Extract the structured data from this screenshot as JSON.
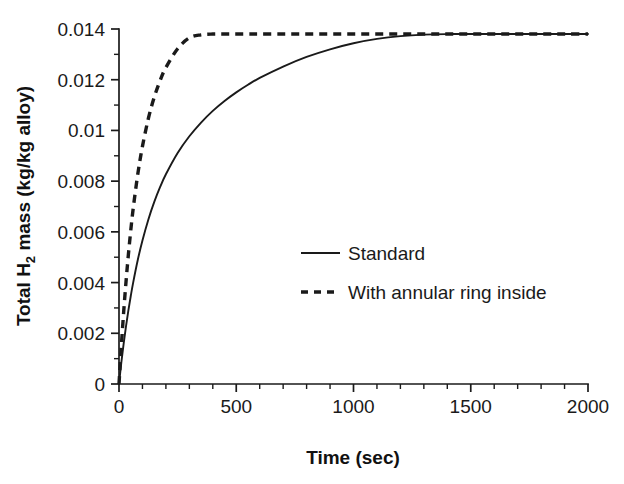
{
  "chart_data": {
    "type": "line",
    "title": "",
    "xlabel": "Time (sec)",
    "ylabel": "Total H2 mass (kg/kg alloy)",
    "ylabel_parts": {
      "prefix": "Total H",
      "subscript": "2",
      "suffix": " mass (kg/kg alloy)"
    },
    "xlim": [
      0,
      2000
    ],
    "ylim": [
      0,
      0.014
    ],
    "grid": false,
    "legend_position": "center",
    "xticks": [
      0,
      500,
      1000,
      1500,
      2000
    ],
    "xtick_labels": [
      "0",
      "500",
      "1000",
      "1500",
      "2000"
    ],
    "x_minor_interval": 100,
    "yticks": [
      0,
      0.002,
      0.004,
      0.006,
      0.008,
      0.01,
      0.012,
      0.014
    ],
    "ytick_labels": [
      "0",
      "0.002",
      "0.004",
      "0.006",
      "0.008",
      "0.01",
      "0.012",
      "0.014"
    ],
    "y_minor_interval": 0.001,
    "plateau_value": 0.0138,
    "x": [
      0,
      10,
      20,
      30,
      40,
      50,
      60,
      80,
      100,
      125,
      150,
      175,
      200,
      250,
      300,
      350,
      400,
      450,
      500,
      550,
      600,
      700,
      800,
      900,
      1000,
      1100,
      1200,
      1300,
      1400,
      1500,
      1600,
      1700,
      1800,
      1900,
      2000
    ],
    "series": [
      {
        "name": "Standard",
        "style": "solid",
        "color": "#1a1a1a",
        "values": [
          0,
          0.00085,
          0.0016,
          0.00228,
          0.0029,
          0.00346,
          0.00398,
          0.00489,
          0.00566,
          0.00648,
          0.00717,
          0.00776,
          0.00827,
          0.00911,
          0.00977,
          0.01031,
          0.01077,
          0.01116,
          0.0115,
          0.0118,
          0.01207,
          0.01252,
          0.0129,
          0.0132,
          0.01344,
          0.01361,
          0.01372,
          0.01378,
          0.0138,
          0.0138,
          0.0138,
          0.0138,
          0.0138,
          0.0138,
          0.0138
        ]
      },
      {
        "name": "With annular ring inside",
        "style": "dashed",
        "color": "#1a1a1a",
        "values": [
          0,
          0.0015,
          0.00285,
          0.00404,
          0.0051,
          0.00604,
          0.00688,
          0.00827,
          0.00937,
          0.01046,
          0.0113,
          0.01196,
          0.01248,
          0.01322,
          0.01365,
          0.01377,
          0.0138,
          0.0138,
          0.0138,
          0.0138,
          0.0138,
          0.0138,
          0.0138,
          0.0138,
          0.0138,
          0.0138,
          0.0138,
          0.0138,
          0.0138,
          0.0138,
          0.0138,
          0.0138,
          0.0138,
          0.0138,
          0.0138
        ]
      }
    ],
    "legend": [
      {
        "label": "Standard",
        "style": "solid"
      },
      {
        "label": "With annular ring inside",
        "style": "dashed"
      }
    ]
  },
  "colors": {
    "ink": "#1a1a1a",
    "background": "#ffffff"
  }
}
